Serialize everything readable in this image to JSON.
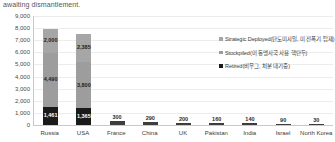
{
  "caption": "awaiting dismantlement.",
  "chart_data": {
    "type": "bar",
    "subtype": "stacked-bar",
    "title": "",
    "xlabel": "",
    "ylabel": "",
    "ylim": [
      0,
      9000
    ],
    "yticks": [
      "9,000",
      "8,000",
      "7,000",
      "6,000",
      "5,000",
      "4,000",
      "3,000",
      "2,000",
      "1,000",
      "0"
    ],
    "ytick_values": [
      9000,
      8000,
      7000,
      6000,
      5000,
      4000,
      3000,
      2000,
      1000,
      0
    ],
    "grid": true,
    "legend_position": "inside-right",
    "categories": [
      "Russia",
      "USA",
      "France",
      "China",
      "UK",
      "Pakistan",
      "India",
      "Israel",
      "North Korea"
    ],
    "series": [
      {
        "name": "Strategic Deployed(탄도미사일, 미 전폭기 탑재)",
        "color": "#a6a6a6",
        "values": [
          2000,
          2385,
          0,
          0,
          0,
          0,
          0,
          0,
          0
        ],
        "labels": [
          "2,000",
          "2,385",
          "",
          "",
          "",
          "",
          "",
          "",
          ""
        ]
      },
      {
        "name": "Stockpiled(미 동맹사국 사용 핵탄두)",
        "color": "#9d9d9d",
        "values": [
          4490,
          3800,
          300,
          290,
          200,
          160,
          140,
          90,
          30
        ],
        "labels": [
          "4,490",
          "3,800",
          "300",
          "290",
          "200",
          "160",
          "140",
          "90",
          "30"
        ]
      },
      {
        "name": "Retired(비무그, 처분 대기중)",
        "color": "#1a1a1a",
        "values": [
          1461,
          1365,
          0,
          0,
          0,
          0,
          0,
          0,
          0
        ],
        "labels": [
          "1,461",
          "1,365",
          "",
          "",
          "",
          "",
          "",
          "",
          ""
        ]
      }
    ],
    "totals": [
      7951,
      7550,
      300,
      290,
      200,
      160,
      140,
      90,
      30
    ]
  },
  "legend": [
    {
      "label": "Strategic Deployed(탄도미사일, 미 전폭기 탑재)",
      "color": "#a6a6a6"
    },
    {
      "label": "Stockpiled(미 동맹사국 사용 핵탄두)",
      "color": "#9d9d9d"
    },
    {
      "label": "Retired(비무그, 처분 대기중)",
      "color": "#1a1a1a"
    }
  ]
}
